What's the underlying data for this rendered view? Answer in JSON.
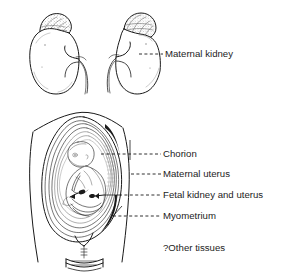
{
  "figure": {
    "background_color": "#ffffff",
    "ink_color": "#1a1a1a"
  },
  "labels": [
    {
      "id": "maternal-kidney",
      "text": "Maternal kidney",
      "text_x": 165,
      "text_y": 57,
      "leader_from_x": 139,
      "leader_from_y": 54,
      "leader_to_x": 163,
      "leader_to_y": 54
    },
    {
      "id": "chorion",
      "text": "Chorion",
      "text_x": 163,
      "text_y": 157,
      "leader_from_x": 101,
      "leader_from_y": 154,
      "leader_to_x": 161,
      "leader_to_y": 154
    },
    {
      "id": "maternal-uterus",
      "text": "Maternal uterus",
      "text_x": 163,
      "text_y": 177,
      "leader_from_x": 131,
      "leader_from_y": 174,
      "leader_to_x": 161,
      "leader_to_y": 174
    },
    {
      "id": "fetal-kidney-and-uterus",
      "text": "Fetal kidney and uterus",
      "text_x": 163,
      "text_y": 198,
      "leader_from_x": 119,
      "leader_from_y": 195,
      "leader_to_x": 161,
      "leader_to_y": 195
    },
    {
      "id": "myometrium",
      "text": "Myometrium",
      "text_x": 163,
      "text_y": 219,
      "leader_from_x": 113,
      "leader_from_y": 216,
      "leader_to_x": 161,
      "leader_to_y": 216
    },
    {
      "id": "other-tissues",
      "text": "?Other tissues",
      "text_x": 163,
      "text_y": 251,
      "leader_from_x": null,
      "leader_from_y": null,
      "leader_to_x": null,
      "leader_to_y": null
    }
  ],
  "structures": {
    "left_kidney": "left maternal kidney with adrenal gland",
    "right_kidney": "right maternal kidney with adrenal gland",
    "uterus_section": "sagittal section of pregnant uterus with fetus",
    "fetus": "fetus in cephalic-curled position",
    "cervix": "cervix and vaginal canal"
  }
}
